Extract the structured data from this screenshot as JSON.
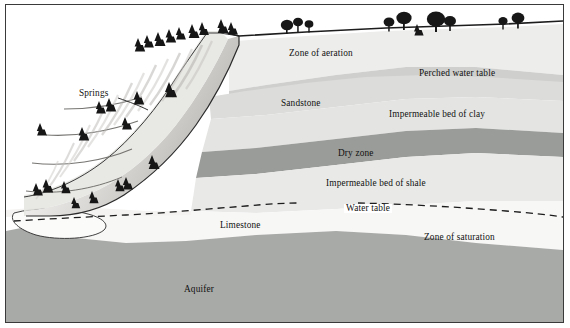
{
  "figure": {
    "frame_color": "#3a3a3a",
    "background": "#ffffff"
  },
  "palette": {
    "zone_of_aeration": "#ededec",
    "perched_band": "#cfd0ce",
    "sandstone": "#dcdddb",
    "clay_band": "#e4e5e3",
    "dry_zone": "#9a9c99",
    "shale": "#e9eae8",
    "limestone_saturation": "#f7f7f6",
    "aquifer": "#a8aaa7",
    "hillside_light": "#f2f1ef",
    "hillside_shadow": "#b9b8b5",
    "ink": "#111111",
    "outline": "#2b2b2b"
  },
  "labels": {
    "springs": "Springs",
    "zone_of_aeration": "Zone of aeration",
    "perched_water_table": "Perched water table",
    "sandstone": "Sandstone",
    "impermeable_bed_of_clay": "Impermeable bed of clay",
    "dry_zone": "Dry zone",
    "impermeable_bed_of_shale": "Impermeable bed of shale",
    "water_table": "Water table",
    "limestone": "Limestone",
    "zone_of_saturation": "Zone of saturation",
    "aquifer": "Aquifer"
  },
  "features": {
    "water_table_line_style": "dashed",
    "springs_leader_line": true,
    "vegetation": {
      "conifers_on_hillside": 22,
      "deciduous_on_plateau": 9
    }
  }
}
